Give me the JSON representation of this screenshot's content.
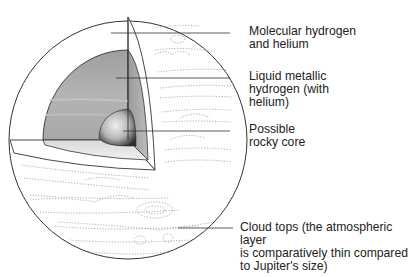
{
  "diagram": {
    "labels": [
      {
        "id": "molecular",
        "text": "Molecular hydrogen\nand helium"
      },
      {
        "id": "metallic",
        "text": "Liquid metallic\nhydrogen (with\nhelium)"
      },
      {
        "id": "core",
        "text": "Possible\nrocky core"
      },
      {
        "id": "clouds",
        "text": "Cloud tops (the atmospheric layer\nis comparatively thin compared\nto Jupiter's size)"
      }
    ],
    "colors": {
      "outline": "#333333",
      "metallic_layer": "#a8a8a8",
      "metallic_side": "#8f8f8f",
      "core_light": "#e6e6e6",
      "core_dark": "#3a3a3a",
      "molecular_layer": "#ffffff"
    }
  }
}
